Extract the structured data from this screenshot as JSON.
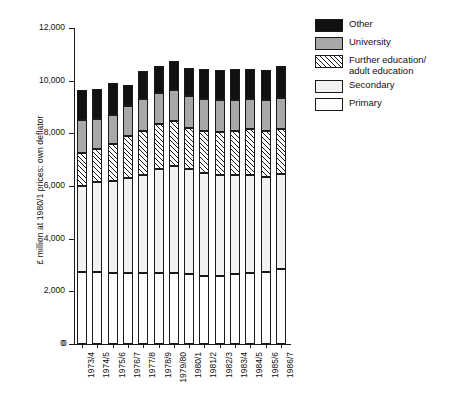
{
  "chart_data": {
    "type": "bar",
    "subtype": "stacked-vertical",
    "title": "",
    "xlabel": "",
    "ylabel": "£ million at 1980/1 prices: own deflator",
    "ylim": [
      0,
      12000
    ],
    "ytick_values": [
      0,
      2000,
      4000,
      6000,
      8000,
      10000,
      12000
    ],
    "ytick_labels": [
      "0",
      "2,000",
      "4,000",
      "6,000",
      "8,000",
      "10,000",
      "12,000"
    ],
    "grid": false,
    "legend_position": "top-right",
    "categories": [
      "1973/4",
      "1974/5",
      "1975/6",
      "1976/7",
      "1977/8",
      "1978/9",
      "1979/80",
      "1980/1",
      "1981/2",
      "1982/3",
      "1983/4",
      "1984/5",
      "1985/6",
      "1986/7"
    ],
    "series": [
      {
        "name": "Primary",
        "fill": "white",
        "values": [
          2750,
          2750,
          2700,
          2700,
          2700,
          2700,
          2700,
          2650,
          2600,
          2600,
          2650,
          2700,
          2750,
          2850
        ]
      },
      {
        "name": "Secondary",
        "fill": "light-gray-dotted",
        "values": [
          3250,
          3400,
          3500,
          3600,
          3700,
          3950,
          4050,
          4000,
          3900,
          3800,
          3750,
          3700,
          3600,
          3600
        ]
      },
      {
        "name": "Further education/\nadult education",
        "fill": "diagonal-hatch",
        "values": [
          1250,
          1250,
          1400,
          1600,
          1700,
          1700,
          1700,
          1550,
          1600,
          1650,
          1700,
          1750,
          1750,
          1700
        ]
      },
      {
        "name": "University",
        "fill": "medium-gray",
        "values": [
          1250,
          1150,
          1100,
          1150,
          1200,
          1200,
          1200,
          1200,
          1200,
          1200,
          1150,
          1150,
          1150,
          1200
        ]
      },
      {
        "name": "Other",
        "fill": "black",
        "values": [
          1150,
          1150,
          1200,
          800,
          1050,
          1000,
          1100,
          1100,
          1150,
          1150,
          1200,
          1150,
          1150,
          1200
        ]
      }
    ],
    "totals": [
      9650,
      9700,
      9900,
      9850,
      10350,
      10550,
      10750,
      10500,
      10450,
      10400,
      10450,
      10450,
      10400,
      10550
    ]
  },
  "legend": {
    "items": [
      {
        "label": "Other",
        "swatch": "black"
      },
      {
        "label": "University",
        "swatch": "medium-gray"
      },
      {
        "label": "Further education/\nadult education",
        "swatch": "diagonal-hatch"
      },
      {
        "label": "Secondary",
        "swatch": "light-gray-dotted"
      },
      {
        "label": "Primary",
        "swatch": "white"
      }
    ]
  },
  "colors": {
    "axis": "#1a1a1a",
    "other": "#111111",
    "university": "#a8a8a8",
    "further_education": "#ffffff",
    "secondary": "#f2f2f2",
    "primary": "#ffffff",
    "background": "#ffffff"
  }
}
